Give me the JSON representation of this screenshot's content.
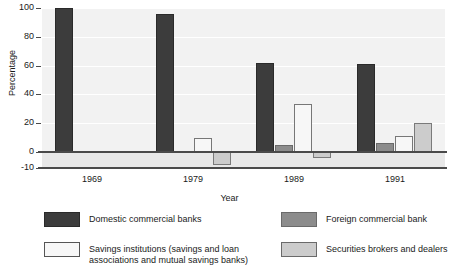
{
  "chart_data": {
    "type": "bar",
    "title": "",
    "xlabel": "Year",
    "ylabel": "Percentage",
    "categories": [
      "1969",
      "1979",
      "1989",
      "1991"
    ],
    "ylim": [
      -10,
      100
    ],
    "yticks": [
      100,
      80,
      60,
      40,
      20,
      0,
      -10
    ],
    "grid": true,
    "legend_position": "bottom",
    "series": [
      {
        "name": "Domestic commercial banks",
        "color": "#3c3c3c",
        "values": [
          100,
          96,
          62,
          61
        ]
      },
      {
        "name": "Foreign commercial bank",
        "color": "#8c8c8c",
        "values": [
          0,
          0,
          5,
          6
        ]
      },
      {
        "name": "Savings institutions  (savings and loan\nassociations and mutual  savings banks)",
        "color": "#f7f7f7",
        "values": [
          0,
          10,
          33,
          11
        ]
      },
      {
        "name": "Securities brokers  and dealers",
        "color": "#cccccc",
        "values": [
          0,
          -8,
          -4,
          20
        ]
      }
    ]
  },
  "axes": {
    "ylabel": "Percentage",
    "xlabel": "Year",
    "ytick_labels": [
      "100",
      "80",
      "60",
      "40",
      "20",
      "0",
      "-10"
    ],
    "xtick_labels": [
      "1969",
      "1979",
      "1989",
      "1991"
    ]
  },
  "legend": {
    "entries": [
      {
        "label": "Domestic commercial banks",
        "color": "#3c3c3c"
      },
      {
        "label": "Foreign commercial bank",
        "color": "#8c8c8c"
      },
      {
        "label": "Savings institutions  (savings and loan\nassociations and mutual  savings banks)",
        "color": "#f7f7f7"
      },
      {
        "label": "Securities brokers  and dealers",
        "color": "#cccccc"
      }
    ]
  }
}
